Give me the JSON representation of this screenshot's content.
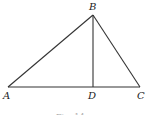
{
  "figure": {
    "type": "triangle with altitude",
    "points": {
      "A": {
        "label": "A"
      },
      "B": {
        "label": "B"
      },
      "C": {
        "label": "C"
      },
      "D": {
        "label": "D"
      }
    },
    "segments": [
      "AB",
      "BC",
      "AC",
      "BD"
    ],
    "caption": "Fig. 14"
  }
}
